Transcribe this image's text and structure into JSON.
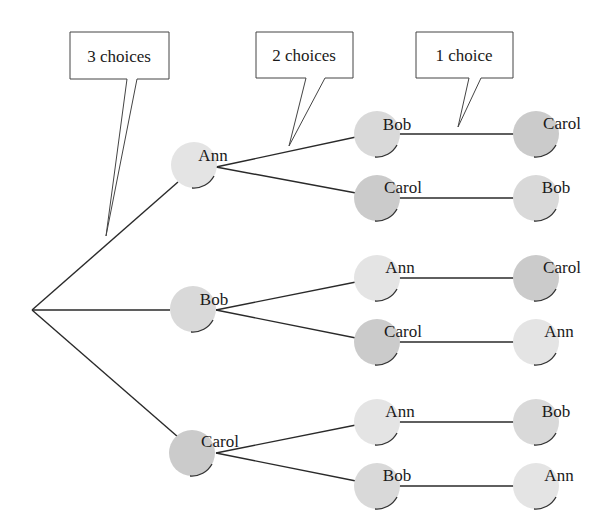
{
  "diagram": {
    "type": "tree",
    "colors": {
      "Ann": "#e4e4e4",
      "Bob": "#d6d6d6",
      "Carol": "#c9c9c9",
      "edge": "#2a2a2a"
    },
    "callouts": [
      {
        "label": "3 choices"
      },
      {
        "label": "2 choices"
      },
      {
        "label": "1 choice"
      }
    ],
    "root": "",
    "level1": [
      {
        "name": "Ann"
      },
      {
        "name": "Bob"
      },
      {
        "name": "Carol"
      }
    ],
    "level2": [
      {
        "name": "Bob",
        "parent": "Ann"
      },
      {
        "name": "Carol",
        "parent": "Ann"
      },
      {
        "name": "Ann",
        "parent": "Bob"
      },
      {
        "name": "Carol",
        "parent": "Bob"
      },
      {
        "name": "Ann",
        "parent": "Carol"
      },
      {
        "name": "Bob",
        "parent": "Carol"
      }
    ],
    "level3": [
      {
        "name": "Carol"
      },
      {
        "name": "Bob"
      },
      {
        "name": "Carol"
      },
      {
        "name": "Ann"
      },
      {
        "name": "Bob"
      },
      {
        "name": "Ann"
      }
    ]
  }
}
